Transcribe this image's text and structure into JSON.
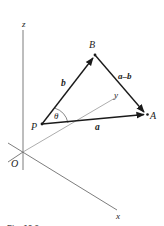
{
  "figure": {
    "caption": "Fig. 10.2",
    "axes": {
      "x_label": "x",
      "y_label": "y",
      "z_label": "z",
      "origin_label": "O"
    },
    "points": {
      "P": {
        "label": "P",
        "x": 42,
        "y": 124
      },
      "B": {
        "label": "B",
        "x": 95,
        "y": 55
      },
      "A": {
        "label": "A",
        "x": 147,
        "y": 114
      }
    },
    "vectors": {
      "b": {
        "label": "b",
        "from": "P",
        "to": "B"
      },
      "a": {
        "label": "a",
        "from": "P",
        "to": "A"
      },
      "a_minus_b": {
        "label": "a–b",
        "from": "B",
        "to": "A"
      }
    },
    "angle": {
      "label": "θ",
      "between": [
        "a",
        "b"
      ],
      "vertex": "P"
    },
    "colors": {
      "vector": "#1a1a1a",
      "axis": "#6e6e6e",
      "text": "#222222"
    }
  }
}
